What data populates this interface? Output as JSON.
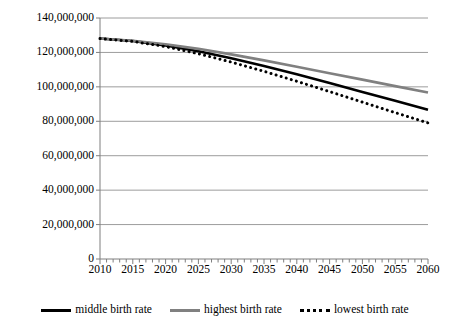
{
  "chart_data": {
    "type": "line",
    "title": "",
    "subtitle": "",
    "xlabel": "",
    "ylabel": "",
    "x": [
      2010,
      2015,
      2020,
      2025,
      2030,
      2035,
      2040,
      2045,
      2050,
      2055,
      2060
    ],
    "xlim": [
      2010,
      2060
    ],
    "ylim": [
      0,
      140000000
    ],
    "xtick_labels": [
      "2010",
      "2015",
      "2020",
      "2025",
      "2030",
      "2035",
      "2040",
      "2045",
      "2050",
      "2055",
      "2060"
    ],
    "ytick_labels": [
      "0",
      "20,000,000",
      "40,000,000",
      "60,000,000",
      "80,000,000",
      "100,000,000",
      "120,000,000",
      "140,000,000"
    ],
    "ytick_values": [
      0,
      20000000,
      40000000,
      60000000,
      80000000,
      100000000,
      120000000,
      140000000
    ],
    "x_minor_tick_interval": 1,
    "grid": "horizontal",
    "legend_position": "bottom",
    "series": [
      {
        "name": "middle birth rate",
        "style": "solid",
        "color": "#000000",
        "width": 2.6,
        "values": [
          128057000,
          126597000,
          124100000,
          120659000,
          116618000,
          112124000,
          107276000,
          102210000,
          97076000,
          91933000,
          86737000
        ]
      },
      {
        "name": "highest birth rate",
        "style": "solid",
        "color": "#808080",
        "width": 2.6,
        "values": [
          128057000,
          126811000,
          124795000,
          122084000,
          118881000,
          115385000,
          111718000,
          107959000,
          104193000,
          100437000,
          96700000
        ]
      },
      {
        "name": "lowest birth rate",
        "style": "dotted",
        "color": "#000000",
        "width": 3.0,
        "values": [
          128057000,
          126383000,
          123415000,
          119260000,
          114398000,
          109020000,
          103245000,
          97236000,
          91135000,
          85030000,
          79070000
        ]
      }
    ]
  },
  "legend": {
    "items": [
      {
        "label": "middle birth rate"
      },
      {
        "label": "highest birth rate"
      },
      {
        "label": "lowest birth rate"
      }
    ]
  },
  "colors": {
    "middle": "#000000",
    "highest": "#808080",
    "lowest": "#000000",
    "gridline": "#9c9c9c",
    "axis": "#7f7f7f",
    "background": "#ffffff"
  }
}
